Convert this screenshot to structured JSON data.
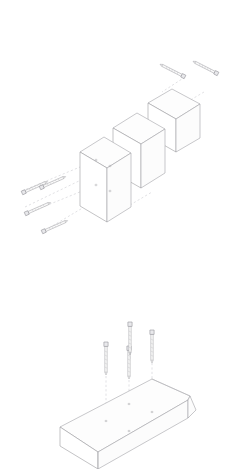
{
  "document": {
    "title": "Exploded Assembly Instruction Diagram",
    "type": "line-art technical illustration",
    "background_color": "#ffffff",
    "line_color": "#9a9a9d",
    "guide_color": "#c3c3c8",
    "hardware_color": "#e9e9ec",
    "width": 232,
    "height": 469,
    "caption": ""
  },
  "figures": [
    {
      "id": "figure-top",
      "name": "upper-exploded-assembly",
      "label": "",
      "description": "Three stacked rectangular blocks in isometric view exploded along the depth axis, with six screws shown separated from the assembly and dashed alignment guides.",
      "parts": [
        {
          "id": "block-front",
          "name": "front-panel-block",
          "label": "",
          "holes": 4
        },
        {
          "id": "block-middle",
          "name": "middle-block",
          "label": "",
          "holes": 0
        },
        {
          "id": "block-rear",
          "name": "rear-block",
          "label": "",
          "holes": 0
        }
      ],
      "fasteners": [
        {
          "id": "screw-tr-1",
          "name": "screw-upper-right-1",
          "label": "",
          "orientation": "diagonal-down-left"
        },
        {
          "id": "screw-tr-2",
          "name": "screw-upper-right-2",
          "label": "",
          "orientation": "diagonal-down-left"
        },
        {
          "id": "screw-l-1",
          "name": "screw-left-1",
          "label": "",
          "orientation": "diagonal-up-right"
        },
        {
          "id": "screw-l-2",
          "name": "screw-left-2",
          "label": "",
          "orientation": "diagonal-up-right"
        },
        {
          "id": "screw-l-3",
          "name": "screw-left-3",
          "label": "",
          "orientation": "diagonal-up-right"
        },
        {
          "id": "screw-l-4",
          "name": "screw-left-4",
          "label": "",
          "orientation": "diagonal-up-right"
        }
      ],
      "guide_lines": 4
    },
    {
      "id": "figure-bottom",
      "name": "lower-exploded-assembly",
      "label": "",
      "description": "A long chamfered beam or tray shown in isometric view with four vertical screws floating above it and dashed drop lines indicating insertion points.",
      "parts": [
        {
          "id": "beam-long",
          "name": "long-beam-tray",
          "label": "",
          "holes": 4
        }
      ],
      "fasteners": [
        {
          "id": "screw-v-1",
          "name": "screw-vertical-1",
          "label": "",
          "orientation": "vertical"
        },
        {
          "id": "screw-v-2",
          "name": "screw-vertical-2",
          "label": "",
          "orientation": "vertical"
        },
        {
          "id": "screw-v-3",
          "name": "screw-vertical-3",
          "label": "",
          "orientation": "vertical"
        },
        {
          "id": "screw-v-4",
          "name": "screw-vertical-4",
          "label": "",
          "orientation": "vertical"
        }
      ],
      "guide_lines": 4
    }
  ]
}
